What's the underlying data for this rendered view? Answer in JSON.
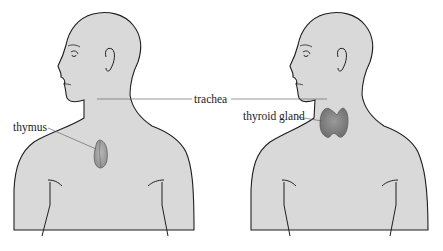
{
  "diagram": {
    "type": "anatomical-illustration",
    "figures": [
      {
        "id": "left-figure",
        "organ": "thymus",
        "label": "thymus"
      },
      {
        "id": "right-figure",
        "organ": "thyroid gland",
        "label": "thyroid gland"
      }
    ],
    "shared_label": "trachea",
    "labels": {
      "thymus": "thymus",
      "trachea": "trachea",
      "thyroid": "thyroid gland"
    },
    "colors": {
      "body_fill": "#d9d9d9",
      "outline": "#1f1f1f",
      "thymus_fill": "#a8a8a8",
      "thyroid_fill": "#8a8a8a",
      "leader_line": "#555555"
    }
  }
}
